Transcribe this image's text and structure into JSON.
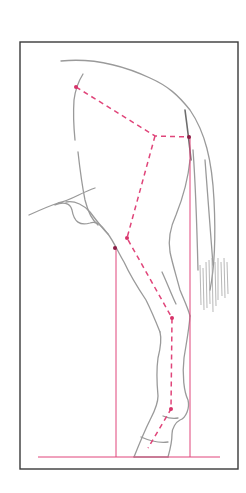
{
  "figure": {
    "colors": {
      "frame": "#3a3a3a",
      "sketch": "#9a9a9a",
      "guide_lines": "#e0457a",
      "points": "#d7336a",
      "background": "#ffffff"
    },
    "frame": {
      "x": 20,
      "y": 42,
      "width": 218,
      "height": 427
    },
    "landmarks": [
      {
        "name": "point-of-hip",
        "x": 76,
        "y": 87
      },
      {
        "name": "hip-joint",
        "x": 155,
        "y": 136
      },
      {
        "name": "point-of-buttock",
        "x": 189,
        "y": 137
      },
      {
        "name": "stifle",
        "x": 127,
        "y": 238
      },
      {
        "name": "stifle-front",
        "x": 115,
        "y": 248
      },
      {
        "name": "hock",
        "x": 172,
        "y": 318
      },
      {
        "name": "fetlock",
        "x": 171,
        "y": 409
      }
    ],
    "plumb_lines": [
      {
        "name": "stifle-plumb-line",
        "x": 116,
        "y1": 248,
        "y2": 457
      },
      {
        "name": "buttock-plumb-line",
        "x": 190,
        "y1": 137,
        "y2": 457
      }
    ],
    "ground_line": {
      "x1": 38,
      "x2": 220,
      "y": 457
    }
  }
}
